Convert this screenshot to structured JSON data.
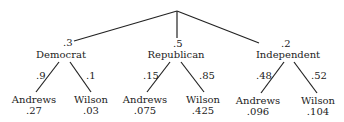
{
  "root": {
    "x": 177,
    "y": 11
  },
  "parties": [
    {
      "name": "Democrat",
      "prob": ".3",
      "node": {
        "x": 72,
        "y": 41
      },
      "outcomes": [
        {
          "candidate": "Andrews",
          "branch_prob": ".9",
          "joint_prob": ".27"
        },
        {
          "candidate": "Wilson",
          "branch_prob": ".1",
          "joint_prob": ".03"
        }
      ]
    },
    {
      "name": "Republican",
      "prob": ".5",
      "node": {
        "x": 177,
        "y": 38
      },
      "outcomes": [
        {
          "candidate": "Andrews",
          "branch_prob": ".15",
          "joint_prob": ".075"
        },
        {
          "candidate": "Wilson",
          "branch_prob": ".85",
          "joint_prob": ".425"
        }
      ]
    },
    {
      "name": "Independent",
      "prob": ".2",
      "node": {
        "x": 261,
        "y": 43
      },
      "outcomes": [
        {
          "candidate": "Andrews",
          "branch_prob": ".48",
          "joint_prob": ".096"
        },
        {
          "candidate": "Wilson",
          "branch_prob": ".52",
          "joint_prob": ".104"
        }
      ]
    }
  ],
  "colors": {
    "line": "#222222",
    "text": "#222222",
    "background": "#ffffff"
  }
}
